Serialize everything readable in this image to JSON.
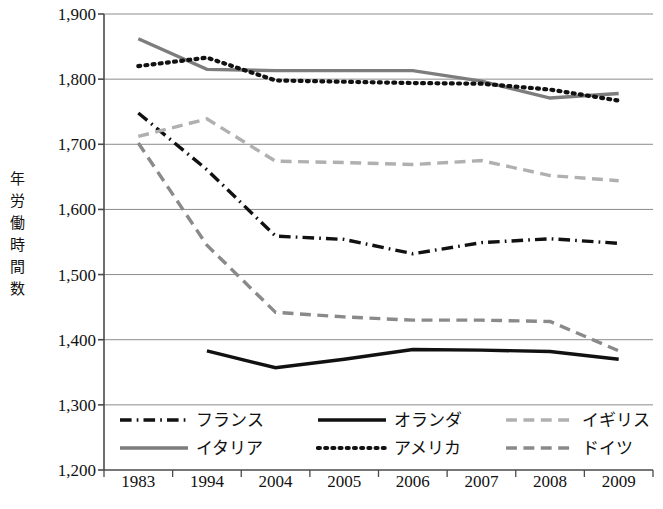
{
  "axis": {
    "y_title": "年労働時間数",
    "y_title_chars": [
      "年",
      "労",
      "働",
      "時",
      "間",
      "数"
    ],
    "y_ticks": [
      "1,900",
      "1,800",
      "1,700",
      "1,600",
      "1,500",
      "1,400",
      "1,300",
      "1,200"
    ],
    "x_ticks": [
      "1983",
      "1994",
      "2004",
      "2005",
      "2006",
      "2007",
      "2008",
      "2009"
    ]
  },
  "legend": {
    "items": [
      {
        "label": "フランス",
        "style": "dashdot",
        "color": "#111111",
        "width": 3.2
      },
      {
        "label": "オランダ",
        "style": "solid",
        "color": "#111111",
        "width": 3.2
      },
      {
        "label": "イギリス",
        "style": "dash",
        "color": "#b0b0b0",
        "width": 3.2
      },
      {
        "label": "イタリア",
        "style": "solid",
        "color": "#7d7d7d",
        "width": 3.4
      },
      {
        "label": "アメリカ",
        "style": "dotted",
        "color": "#111111",
        "width": 3.4
      },
      {
        "label": "ドイツ",
        "style": "dash",
        "color": "#8a8a8a",
        "width": 3.4
      }
    ]
  },
  "chart_data": {
    "type": "line",
    "title": "",
    "xlabel": "",
    "ylabel": "年労働時間数",
    "categories": [
      "1983",
      "1994",
      "2004",
      "2005",
      "2006",
      "2007",
      "2008",
      "2009"
    ],
    "ylim": [
      1200,
      1900
    ],
    "ytick_values": [
      1900,
      1800,
      1700,
      1600,
      1500,
      1400,
      1300,
      1200
    ],
    "grid": "horizontal",
    "legend_position": "bottom",
    "series": [
      {
        "name": "フランス",
        "style": "dashdot",
        "color": "#111111",
        "values": [
          1748,
          1661,
          1559,
          1554,
          1532,
          1549,
          1555,
          1548
        ]
      },
      {
        "name": "オランダ",
        "style": "solid",
        "color": "#111111",
        "values": [
          null,
          1383,
          1357,
          1370,
          1385,
          1384,
          1382,
          1370
        ]
      },
      {
        "name": "イギリス",
        "style": "dash",
        "color": "#b0b0b0",
        "values": [
          1712,
          1739,
          1674,
          1672,
          1669,
          1675,
          1652,
          1644
        ]
      },
      {
        "name": "イタリア",
        "style": "solid",
        "color": "#7d7d7d",
        "values": [
          1862,
          1815,
          1813,
          1813,
          1813,
          1797,
          1771,
          1778
        ]
      },
      {
        "name": "アメリカ",
        "style": "dotted",
        "color": "#111111",
        "values": [
          1820,
          1833,
          1798,
          1796,
          1794,
          1793,
          1784,
          1767
        ]
      },
      {
        "name": "ドイツ",
        "style": "dash",
        "color": "#8a8a8a",
        "values": [
          1702,
          1545,
          1442,
          1435,
          1430,
          1430,
          1428,
          1383
        ]
      }
    ]
  }
}
